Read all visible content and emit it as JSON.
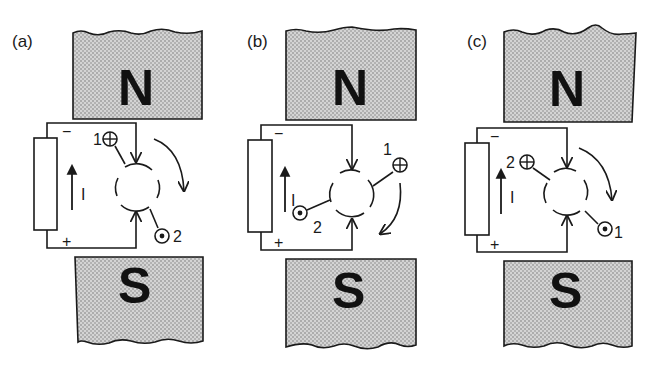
{
  "figure": {
    "colors": {
      "ink": "#1a1a1a",
      "magnet_fill": "#c8c8c8",
      "background": "#ffffff"
    },
    "panels": [
      {
        "id": "a",
        "label": "(a)",
        "north_label": "N",
        "south_label": "S",
        "battery": {
          "minus": "−",
          "plus": "+"
        },
        "current_label": "I",
        "conductor_into": {
          "symbol": "⊕",
          "number": "1"
        },
        "conductor_out": {
          "symbol": "⊙",
          "number": "2"
        },
        "rotation": "clockwise"
      },
      {
        "id": "b",
        "label": "(b)",
        "north_label": "N",
        "south_label": "S",
        "battery": {
          "minus": "−",
          "plus": "+"
        },
        "current_label": "I",
        "conductor_into": {
          "symbol": "⊕",
          "number": "1"
        },
        "conductor_out": {
          "symbol": "⊙",
          "number": "2"
        },
        "rotation": "clockwise"
      },
      {
        "id": "c",
        "label": "(c)",
        "north_label": "N",
        "south_label": "S",
        "battery": {
          "minus": "−",
          "plus": "+"
        },
        "current_label": "I",
        "conductor_into": {
          "symbol": "⊕",
          "number": "2"
        },
        "conductor_out": {
          "symbol": "⊙",
          "number": "1"
        },
        "rotation": "clockwise"
      }
    ]
  }
}
